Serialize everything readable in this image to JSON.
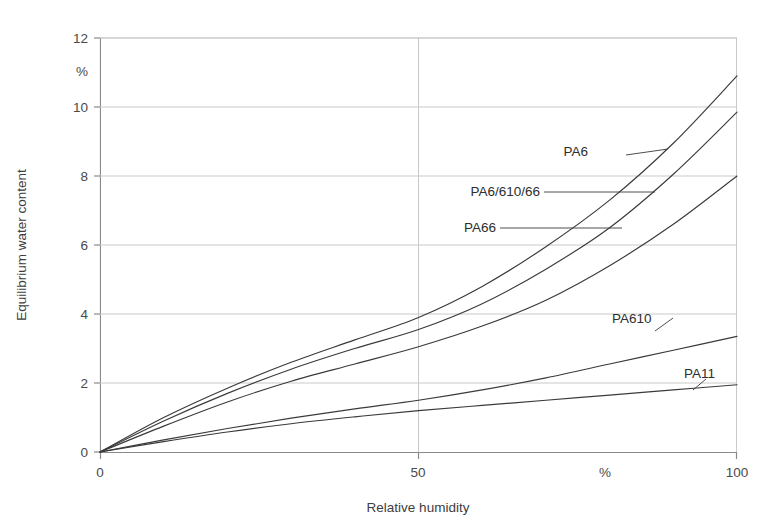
{
  "chart_data": {
    "type": "line",
    "title": "",
    "xlabel": "Relative humidity",
    "ylabel": "Equilibrium water content",
    "x_unit": "%",
    "y_unit": "%",
    "xlim": [
      0,
      100
    ],
    "ylim": [
      0,
      12
    ],
    "xticks": [
      0,
      50,
      100
    ],
    "xticklabels": [
      "0",
      "50",
      "100"
    ],
    "yticks": [
      0,
      2,
      4,
      6,
      8,
      10,
      12
    ],
    "yticklabels": [
      "0",
      "2",
      "4",
      "6",
      "8",
      "10",
      "12"
    ],
    "grid": "horizontal-and-vertical",
    "legend": "inline-labels-with-leader-lines",
    "x": [
      0,
      10,
      20,
      30,
      40,
      50,
      60,
      70,
      80,
      90,
      100
    ],
    "series": [
      {
        "name": "PA6",
        "values": [
          0,
          1.0,
          1.85,
          2.6,
          3.25,
          3.9,
          4.8,
          5.95,
          7.3,
          8.95,
          10.9
        ],
        "label": "PA6"
      },
      {
        "name": "PA6/610/66",
        "values": [
          0,
          0.9,
          1.7,
          2.4,
          3.0,
          3.55,
          4.3,
          5.3,
          6.5,
          8.05,
          9.85
        ],
        "label": "PA6/610/66"
      },
      {
        "name": "PA66",
        "values": [
          0,
          0.75,
          1.45,
          2.05,
          2.55,
          3.05,
          3.65,
          4.4,
          5.4,
          6.6,
          8.0
        ],
        "label": "PA66"
      },
      {
        "name": "PA610",
        "values": [
          0,
          0.35,
          0.68,
          0.98,
          1.25,
          1.5,
          1.8,
          2.15,
          2.55,
          2.95,
          3.35
        ],
        "label": "PA610"
      },
      {
        "name": "PA11",
        "values": [
          0,
          0.3,
          0.58,
          0.82,
          1.02,
          1.2,
          1.35,
          1.5,
          1.65,
          1.8,
          1.95
        ],
        "label": "PA11"
      }
    ],
    "colors": {
      "curve": "#3a3a3a",
      "grid": "#c9c9c9",
      "axis": "#8a8a8a",
      "text": "#3d3d3d",
      "background": "#ffffff"
    }
  },
  "axes": {
    "y_axis_title": "Equilibrium water content",
    "y_unit_label": "%",
    "x_axis_title": "Relative humidity",
    "x_unit_label": "%"
  },
  "labels": {
    "pa6": "PA6",
    "pa6_610_66": "PA6/610/66",
    "pa66": "PA66",
    "pa610": "PA610",
    "pa11": "PA11"
  },
  "yticks": {
    "t0": "0",
    "t2": "2",
    "t4": "4",
    "t6": "6",
    "t8": "8",
    "t10": "10",
    "t12": "12"
  },
  "xticks": {
    "t0": "0",
    "t50": "50",
    "t100": "100"
  }
}
